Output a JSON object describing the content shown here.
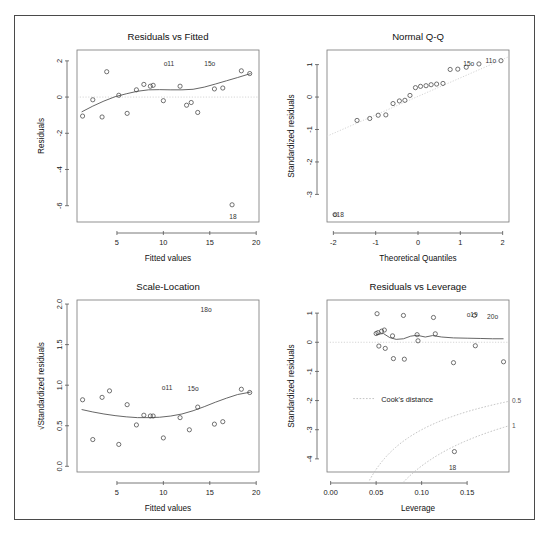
{
  "figure": {
    "background": "#ffffff",
    "frame_color": "#4a4a4a",
    "point_color": "#444444",
    "line_color": "#555555",
    "reference_color": "#cccccc"
  },
  "chart_data": [
    {
      "id": "residuals-vs-fitted",
      "type": "scatter",
      "title": "Residuals vs Fitted",
      "xlabel": "Fitted values",
      "ylabel": "Residuals",
      "xlim": [
        0.7,
        20.3
      ],
      "ylim": [
        -6.9,
        2.6
      ],
      "xticks": [
        5,
        10,
        15,
        20
      ],
      "xticklabels": [
        "5",
        "10",
        "15",
        "20"
      ],
      "yticks": [
        2,
        0,
        -2,
        -4,
        -6
      ],
      "yticklabels": [
        "2",
        "0",
        "-2",
        "-4",
        "-6"
      ],
      "grid": false,
      "x": [
        1.3,
        2.4,
        3.4,
        3.9,
        5.2,
        6.1,
        7.1,
        7.9,
        8.6,
        8.9,
        10.0,
        11.8,
        12.5,
        13.0,
        13.7,
        15.5,
        16.4,
        17.4,
        18.4,
        19.3
      ],
      "y": [
        -1.05,
        -0.15,
        -1.1,
        1.4,
        0.1,
        -0.9,
        0.4,
        0.7,
        0.6,
        0.65,
        -0.2,
        0.6,
        -0.45,
        -0.3,
        -0.85,
        0.45,
        0.5,
        -5.95,
        1.45,
        1.3
      ],
      "smooth": [
        [
          1.2,
          -0.82
        ],
        [
          2.4,
          -0.5
        ],
        [
          3.6,
          -0.22
        ],
        [
          4.8,
          0.02
        ],
        [
          6.0,
          0.18
        ],
        [
          7.2,
          0.32
        ],
        [
          8.4,
          0.4
        ],
        [
          9.6,
          0.41
        ],
        [
          10.8,
          0.4
        ],
        [
          12.0,
          0.4
        ],
        [
          13.2,
          0.43
        ],
        [
          14.4,
          0.55
        ],
        [
          15.6,
          0.72
        ],
        [
          16.8,
          0.9
        ],
        [
          18.0,
          1.08
        ],
        [
          19.4,
          1.3
        ]
      ],
      "reference_line": {
        "type": "horizontal",
        "value": 0
      },
      "annotations": [
        {
          "text": "o11",
          "x": 10.6,
          "y": 1.85
        },
        {
          "text": "15o",
          "x": 15.0,
          "y": 1.8
        },
        {
          "text": "18",
          "x": 17.5,
          "y": -6.6
        }
      ]
    },
    {
      "id": "normal-qq",
      "type": "scatter",
      "title": "Normal Q-Q",
      "xlabel": "Theoretical Quantiles",
      "ylabel": "Standardized residuals",
      "xlim": [
        -2.15,
        2.15
      ],
      "ylim": [
        -3.85,
        1.45
      ],
      "xticks": [
        -2,
        -1,
        0,
        1,
        2
      ],
      "xticklabels": [
        "-2",
        "-1",
        "0",
        "1",
        "2"
      ],
      "yticks": [
        1,
        0,
        -1,
        -2,
        -3
      ],
      "yticklabels": [
        "1",
        "0",
        "-1",
        "-2",
        "-3"
      ],
      "grid": false,
      "x": [
        -1.96,
        -1.44,
        -1.14,
        -0.94,
        -0.76,
        -0.59,
        -0.44,
        -0.31,
        -0.19,
        -0.06,
        0.06,
        0.19,
        0.31,
        0.44,
        0.59,
        0.76,
        0.94,
        1.14,
        1.44,
        1.96
      ],
      "y": [
        -3.62,
        -0.72,
        -0.66,
        -0.56,
        -0.55,
        -0.2,
        -0.12,
        -0.1,
        0.05,
        0.29,
        0.33,
        0.35,
        0.38,
        0.4,
        0.42,
        0.85,
        0.86,
        0.92,
        1.02,
        1.12
      ],
      "qq_line": {
        "slope": 0.57,
        "intercept": 0.02
      },
      "annotations": [
        {
          "text": "o18",
          "x": -1.88,
          "y": -3.62
        },
        {
          "text": "15o",
          "x": 1.2,
          "y": 1.02
        },
        {
          "text": "11o",
          "x": 1.72,
          "y": 1.12
        }
      ]
    },
    {
      "id": "scale-location",
      "type": "scatter",
      "title": "Scale-Location",
      "xlabel": "Fitted values",
      "ylabel": "√Standardized residuals",
      "xlim": [
        0.7,
        20.3
      ],
      "ylim": [
        -0.07,
        2.05
      ],
      "xticks": [
        5,
        10,
        15,
        20
      ],
      "xticklabels": [
        "5",
        "10",
        "15",
        "20"
      ],
      "yticks": [
        0.0,
        0.5,
        1.0,
        1.5,
        2.0
      ],
      "yticklabels": [
        "0.0",
        "0.5",
        "1.0",
        "1.5",
        "2.0"
      ],
      "grid": false,
      "x": [
        1.3,
        2.4,
        3.4,
        4.2,
        5.2,
        6.1,
        7.1,
        7.9,
        8.6,
        8.9,
        10.0,
        11.8,
        12.8,
        13.7,
        15.5,
        16.4,
        18.4,
        19.3
      ],
      "y": [
        0.82,
        0.33,
        0.85,
        0.93,
        0.27,
        0.76,
        0.51,
        0.63,
        0.62,
        0.62,
        0.35,
        0.6,
        0.45,
        0.73,
        0.52,
        0.55,
        0.95,
        0.91
      ],
      "smooth": [
        [
          1.2,
          0.7
        ],
        [
          2.4,
          0.67
        ],
        [
          3.6,
          0.645
        ],
        [
          4.8,
          0.625
        ],
        [
          6.0,
          0.61
        ],
        [
          7.2,
          0.6
        ],
        [
          8.4,
          0.6
        ],
        [
          9.6,
          0.605
        ],
        [
          10.8,
          0.62
        ],
        [
          12.0,
          0.645
        ],
        [
          13.2,
          0.685
        ],
        [
          14.4,
          0.735
        ],
        [
          15.6,
          0.79
        ],
        [
          16.8,
          0.84
        ],
        [
          18.0,
          0.885
        ],
        [
          19.4,
          0.915
        ]
      ],
      "annotations": [
        {
          "text": "18o",
          "x": 14.6,
          "y": 1.93
        },
        {
          "text": "o11",
          "x": 10.4,
          "y": 0.97
        },
        {
          "text": "15o",
          "x": 13.2,
          "y": 0.95
        }
      ]
    },
    {
      "id": "residuals-vs-leverage",
      "type": "scatter",
      "title": "Residuals vs Leverage",
      "xlabel": "Leverage",
      "ylabel": "Standardized residuals",
      "xlim": [
        -0.004,
        0.196
      ],
      "ylim": [
        -4.45,
        1.45
      ],
      "xticks": [
        0.0,
        0.05,
        0.1,
        0.15
      ],
      "xticklabels": [
        "0.00",
        "0.05",
        "0.10",
        "0.15"
      ],
      "yticks": [
        1,
        0,
        -1,
        -2,
        -3,
        -4
      ],
      "yticklabels": [
        "1",
        "0",
        "-1",
        "-2",
        "-3",
        "-4"
      ],
      "grid": false,
      "x": [
        0.05,
        0.051,
        0.052,
        0.053,
        0.056,
        0.059,
        0.06,
        0.068,
        0.069,
        0.08,
        0.081,
        0.095,
        0.096,
        0.113,
        0.115,
        0.135,
        0.136,
        0.158,
        0.159,
        0.19
      ],
      "y": [
        0.3,
        0.98,
        0.33,
        -0.13,
        0.38,
        0.42,
        -0.21,
        0.22,
        -0.56,
        0.92,
        -0.58,
        0.26,
        0.05,
        0.85,
        0.29,
        -0.7,
        -3.75,
        0.92,
        -0.12,
        -0.67
      ],
      "smooth": [
        [
          0.05,
          0.27
        ],
        [
          0.058,
          0.3
        ],
        [
          0.065,
          0.16
        ],
        [
          0.072,
          0.1
        ],
        [
          0.08,
          0.12
        ],
        [
          0.088,
          0.21
        ],
        [
          0.095,
          0.24
        ],
        [
          0.104,
          0.18
        ],
        [
          0.112,
          0.23
        ],
        [
          0.122,
          0.18
        ],
        [
          0.135,
          0.15
        ],
        [
          0.15,
          0.14
        ],
        [
          0.165,
          0.13
        ],
        [
          0.178,
          0.12
        ],
        [
          0.19,
          0.12
        ]
      ],
      "reference_line": {
        "type": "horizontal",
        "value": 0
      },
      "cooks_levels": [
        0.5,
        1
      ],
      "cooks_labels": [
        "0.5",
        "1"
      ],
      "legend": {
        "label": "Cook's distance",
        "x": 0.038,
        "y": -2.0
      },
      "annotations": [
        {
          "text": "o19",
          "x": 0.1555,
          "y": 0.92
        },
        {
          "text": "20o",
          "x": 0.178,
          "y": 0.88
        },
        {
          "text": "18",
          "x": 0.134,
          "y": -4.3
        }
      ]
    }
  ]
}
